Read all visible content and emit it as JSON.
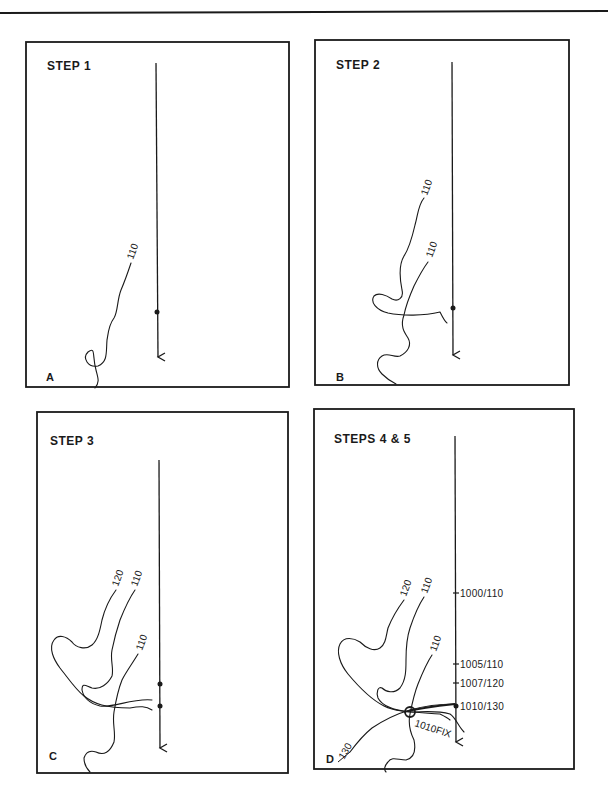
{
  "figure": {
    "panels": [
      {
        "id": "A",
        "title": "STEP 1",
        "letter": "A",
        "contours": [
          {
            "label": "110"
          }
        ],
        "track_positions": 1
      },
      {
        "id": "B",
        "title": "STEP 2",
        "letter": "B",
        "contours": [
          {
            "label": "110"
          },
          {
            "label": "110"
          }
        ],
        "track_positions": 1
      },
      {
        "id": "C",
        "title": "STEP 3",
        "letter": "C",
        "contours": [
          {
            "label": "120"
          },
          {
            "label": "110"
          },
          {
            "label": "110"
          }
        ],
        "track_positions": 2
      },
      {
        "id": "D",
        "title": "STEPS 4 & 5",
        "letter": "D",
        "contours": [
          {
            "label": "120"
          },
          {
            "label": "110"
          },
          {
            "label": "110"
          },
          {
            "label": "130"
          }
        ],
        "track_marks": [
          {
            "label": "1000/110"
          },
          {
            "label": "1005/110"
          },
          {
            "label": "1007/120"
          },
          {
            "label": "1010/130"
          }
        ],
        "fix_label": "1010FIX"
      }
    ]
  },
  "colors": {
    "ink": "#1a1a1a",
    "paper": "#ffffff"
  }
}
